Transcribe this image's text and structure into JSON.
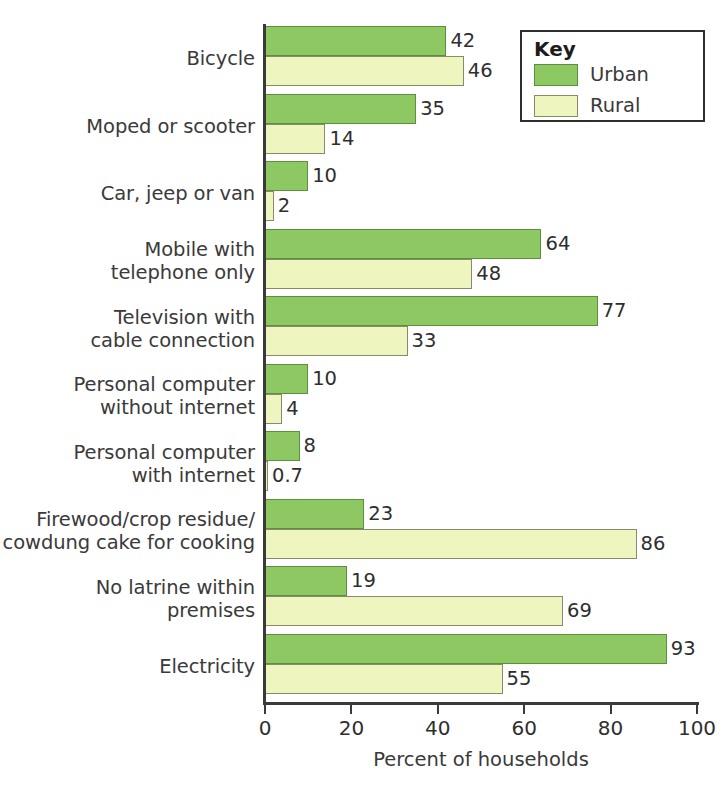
{
  "chart_data": {
    "type": "bar",
    "orientation": "horizontal",
    "title": "",
    "xlabel": "Percent of households",
    "ylabel": "",
    "xlim": [
      0,
      100
    ],
    "xticks": [
      0,
      20,
      40,
      60,
      80,
      100
    ],
    "grid": false,
    "legend_position": "top-right",
    "legend_title": "Key",
    "categories": [
      "Bicycle",
      "Moped or scooter",
      "Car, jeep or van",
      "Mobile with telephone only",
      "Television with cable connection",
      "Personal computer without internet",
      "Personal computer with internet",
      "Firewood/crop residue/ cowdung cake for cooking",
      "No latrine within premises",
      "Electricity"
    ],
    "category_lines": [
      [
        "Bicycle"
      ],
      [
        "Moped or scooter"
      ],
      [
        "Car, jeep or van"
      ],
      [
        "Mobile with",
        "telephone only"
      ],
      [
        "Television with",
        "cable connection"
      ],
      [
        "Personal computer",
        "without internet"
      ],
      [
        "Personal computer",
        "with internet"
      ],
      [
        "Firewood/crop residue/",
        "cowdung cake for cooking"
      ],
      [
        "No latrine within",
        "premises"
      ],
      [
        "Electricity"
      ]
    ],
    "series": [
      {
        "name": "Urban",
        "color": "#8dc863",
        "values": [
          42,
          35,
          10,
          64,
          77,
          10,
          8,
          23,
          19,
          93
        ],
        "labels": [
          "42",
          "35",
          "10",
          "64",
          "77",
          "10",
          "8",
          "23",
          "19",
          "93"
        ]
      },
      {
        "name": "Rural",
        "color": "#eef5be",
        "values": [
          46,
          14,
          2,
          48,
          33,
          4,
          0.7,
          86,
          69,
          55
        ],
        "labels": [
          "46",
          "14",
          "2",
          "48",
          "33",
          "4",
          "0.7",
          "86",
          "69",
          "55"
        ]
      }
    ]
  },
  "axis": {
    "x_title": "Percent of households",
    "tick_labels": [
      "0",
      "20",
      "40",
      "60",
      "80",
      "100"
    ]
  },
  "legend": {
    "title": "Key",
    "entries": [
      {
        "label": "Urban",
        "swatch": "urban"
      },
      {
        "label": "Rural",
        "swatch": "rural"
      }
    ]
  }
}
